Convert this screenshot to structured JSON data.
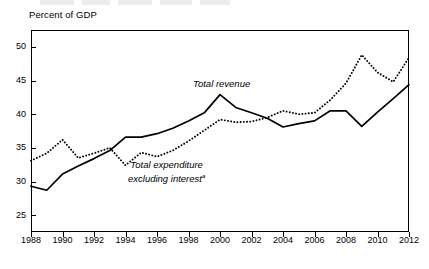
{
  "axis_title": "Percent of GDP",
  "labels": {
    "revenue": "Total revenue",
    "expenditure_line1": "Total expenditure",
    "expenditure_line2": "excluding interest",
    "expenditure_footnote": "a"
  },
  "chart_data": {
    "type": "line",
    "title": "",
    "xlabel": "",
    "ylabel": "Percent of GDP",
    "xlim": [
      1988,
      2012
    ],
    "ylim": [
      22.5,
      52.5
    ],
    "yticks": [
      25,
      30,
      35,
      40,
      45,
      50
    ],
    "xticks": [
      1988,
      1990,
      1992,
      1994,
      1996,
      1998,
      2000,
      2002,
      2004,
      2006,
      2008,
      2010,
      2012
    ],
    "xtick_labels": [
      "1988",
      "1990",
      "1992",
      "1994",
      "1996",
      "1998",
      "2000",
      "2002",
      "2004",
      "2006",
      "2008",
      "2010",
      "2012"
    ],
    "ytick_labels": [
      "25",
      "30",
      "35",
      "40",
      "45",
      "50"
    ],
    "grid": false,
    "legend": "inline-annotations",
    "x": [
      1988,
      1989,
      1990,
      1991,
      1992,
      1993,
      1994,
      1995,
      1996,
      1997,
      1998,
      1999,
      2000,
      2001,
      2002,
      2003,
      2004,
      2005,
      2006,
      2007,
      2008,
      2009,
      2010,
      2011,
      2012
    ],
    "series": [
      {
        "name": "Total revenue",
        "style": "solid",
        "color": "#000000",
        "values": [
          29.3,
          28.7,
          31.1,
          32.3,
          33.4,
          34.6,
          36.6,
          36.6,
          37.1,
          37.9,
          39.0,
          40.2,
          42.9,
          41.0,
          40.2,
          39.4,
          38.1,
          38.6,
          39.0,
          40.5,
          40.5,
          38.2,
          40.3,
          42.3,
          44.4
        ]
      },
      {
        "name": "Total expenditure excluding interest",
        "style": "dotted",
        "color": "#000000",
        "values": [
          33.1,
          34.2,
          36.2,
          33.5,
          34.2,
          35.0,
          32.4,
          34.3,
          33.7,
          34.6,
          36.0,
          37.6,
          39.2,
          38.8,
          38.9,
          39.5,
          40.5,
          40.0,
          40.2,
          42.1,
          44.6,
          48.8,
          46.2,
          44.8,
          48.4
        ]
      }
    ]
  }
}
